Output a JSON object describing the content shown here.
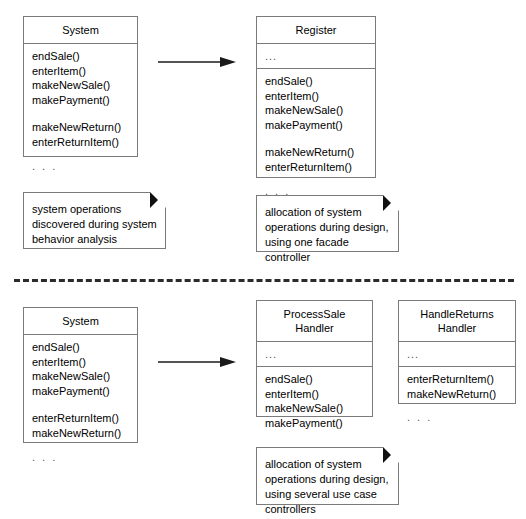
{
  "diagram": {
    "colors": {
      "box_border": "#7b7b7b",
      "note_border": "#7b7b7b",
      "fold": "#111111",
      "arrow": "#1a1a1a",
      "divider": "#2b2b2b",
      "background": "#ffffff",
      "text": "#000000",
      "muted_text": "#555555"
    },
    "ellipsis": ". . .",
    "attrs_ellipsis": "...",
    "divider_label": "dashed-separator"
  },
  "top_section": {
    "source_class": {
      "name": "System",
      "operations": [
        {
          "text": "endSale()",
          "gap_before": false
        },
        {
          "text": "enterItem()",
          "gap_before": false
        },
        {
          "text": "makeNewSale()",
          "gap_before": false
        },
        {
          "text": "makePayment()",
          "gap_before": false
        },
        {
          "text": "makeNewReturn()",
          "gap_before": true
        },
        {
          "text": "enterReturnItem()",
          "gap_before": false
        }
      ],
      "trailing_ellipsis": ". . ."
    },
    "arrow": {
      "name": "allocation-arrow-top",
      "direction": "right"
    },
    "target_classes": [
      {
        "name": "Register",
        "attributes": "...",
        "operations": [
          {
            "text": "endSale()",
            "gap_before": false
          },
          {
            "text": "enterItem()",
            "gap_before": false
          },
          {
            "text": "makeNewSale()",
            "gap_before": false
          },
          {
            "text": "makePayment()",
            "gap_before": false
          },
          {
            "text": "makeNewReturn()",
            "gap_before": true
          },
          {
            "text": "enterReturnItem()",
            "gap_before": false
          }
        ],
        "trailing_ellipsis": ". . ."
      }
    ],
    "notes": [
      {
        "name": "note-system-operations",
        "text": "system operations\ndiscovered during system\nbehavior analysis"
      },
      {
        "name": "note-facade-controller",
        "text": "allocation of system\noperations during design,\nusing one facade controller"
      }
    ]
  },
  "bottom_section": {
    "source_class": {
      "name": "System",
      "operations": [
        {
          "text": "endSale()",
          "gap_before": false
        },
        {
          "text": "enterItem()",
          "gap_before": false
        },
        {
          "text": "makeNewSale()",
          "gap_before": false
        },
        {
          "text": "makePayment()",
          "gap_before": false
        },
        {
          "text": "enterReturnItem()",
          "gap_before": true
        },
        {
          "text": "makeNewReturn()",
          "gap_before": false
        }
      ],
      "trailing_ellipsis": ". . ."
    },
    "arrow": {
      "name": "allocation-arrow-bottom",
      "direction": "right"
    },
    "target_classes": [
      {
        "name": "ProcessSale\nHandler",
        "attributes": "...",
        "operations": [
          {
            "text": "endSale()",
            "gap_before": false
          },
          {
            "text": "enterItem()",
            "gap_before": false
          },
          {
            "text": "makeNewSale()",
            "gap_before": false
          },
          {
            "text": "makePayment()",
            "gap_before": false
          }
        ],
        "trailing_ellipsis": ""
      },
      {
        "name": "HandleReturns\nHandler",
        "attributes": "...",
        "operations": [
          {
            "text": "enterReturnItem()",
            "gap_before": false
          },
          {
            "text": "makeNewReturn()",
            "gap_before": false
          }
        ],
        "trailing_ellipsis": ". . ."
      }
    ],
    "notes": [
      {
        "name": "note-use-case-controllers",
        "text": "allocation of system\noperations during design,\nusing several use case\ncontrollers"
      }
    ]
  }
}
